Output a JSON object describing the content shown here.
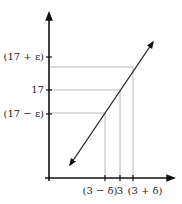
{
  "diagram": {
    "colors": {
      "axis": "#111111",
      "guide": "#b8b8b8",
      "line": "#222222"
    },
    "y_axis": {
      "ticks": [
        {
          "label": "(17 + ε)",
          "y": 57
        },
        {
          "label": "17",
          "y": 90
        },
        {
          "label": "(17 − ε)",
          "y": 114
        }
      ]
    },
    "x_axis": {
      "ticks": [
        {
          "label": "(3 − δ)",
          "x": 105
        },
        {
          "label": "3",
          "x": 120
        },
        {
          "label": "(3 + δ)",
          "x": 133
        }
      ]
    },
    "line": {
      "x1": 70,
      "y1": 165,
      "x2": 153,
      "y2": 42
    }
  }
}
